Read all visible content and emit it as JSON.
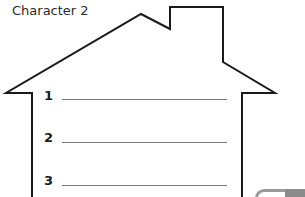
{
  "worksheet": {
    "title": "Character 2",
    "outline_color": "#1a1a1a",
    "line_color": "#7a7a7a",
    "items": [
      {
        "number": "1",
        "answer": ""
      },
      {
        "number": "2",
        "answer": ""
      },
      {
        "number": "3",
        "answer": ""
      }
    ]
  }
}
